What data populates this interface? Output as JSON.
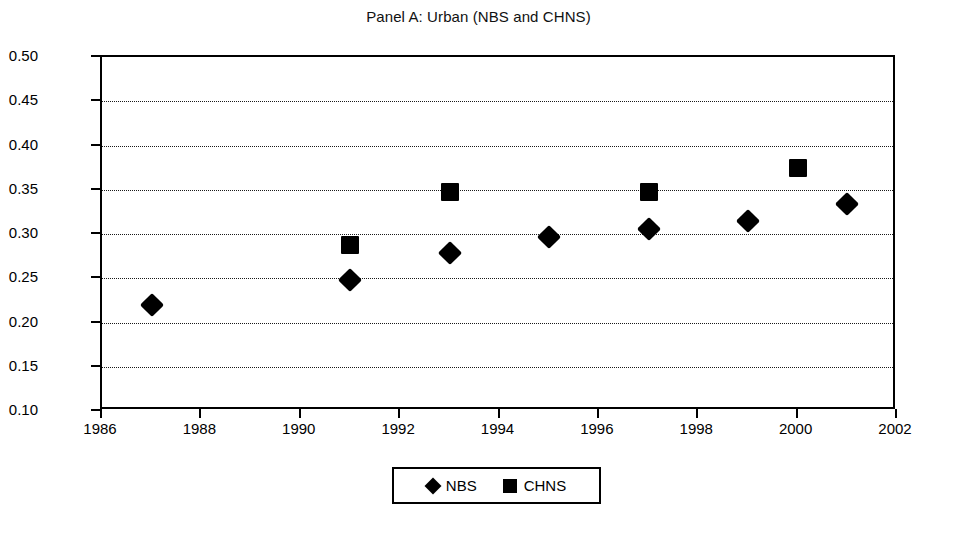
{
  "chart_data": {
    "type": "scatter",
    "title": "Panel A: Urban (NBS and CHNS)",
    "xlabel": "",
    "ylabel": "",
    "xlim": [
      1986,
      2002
    ],
    "ylim": [
      0.1,
      0.5
    ],
    "grid": "horizontal-dotted",
    "legend_position": "bottom-center",
    "x_ticks": [
      "1986",
      "1988",
      "1990",
      "1992",
      "1994",
      "1996",
      "1998",
      "2000",
      "2002"
    ],
    "x_tick_values": [
      1986,
      1988,
      1990,
      1992,
      1994,
      1996,
      1998,
      2000,
      2002
    ],
    "y_ticks": [
      "0.10",
      "0.15",
      "0.20",
      "0.25",
      "0.30",
      "0.35",
      "0.40",
      "0.45",
      "0.50"
    ],
    "y_tick_values": [
      0.1,
      0.15,
      0.2,
      0.25,
      0.3,
      0.35,
      0.4,
      0.45,
      0.5
    ],
    "series": [
      {
        "name": "NBS",
        "marker": "diamond",
        "color": "#000000",
        "x": [
          1987,
          1991,
          1993,
          1995,
          1997,
          1999,
          2001
        ],
        "values": [
          0.22,
          0.248,
          0.278,
          0.297,
          0.306,
          0.315,
          0.334
        ]
      },
      {
        "name": "CHNS",
        "marker": "square",
        "color": "#000000",
        "x": [
          1991,
          1993,
          1997,
          2000
        ],
        "values": [
          0.288,
          0.347,
          0.347,
          0.375
        ]
      }
    ]
  },
  "legend": {
    "entries": [
      {
        "label": "NBS",
        "marker": "diamond"
      },
      {
        "label": "CHNS",
        "marker": "square"
      }
    ]
  }
}
